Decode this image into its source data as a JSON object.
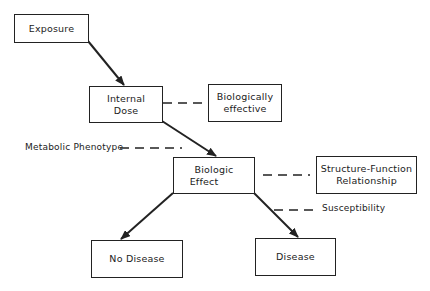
{
  "diagram": {
    "nodes": {
      "exposure": {
        "lines": [
          "Exposure"
        ]
      },
      "internal_dose": {
        "lines": [
          "Internal",
          "Dose"
        ]
      },
      "biologically_effective": {
        "lines": [
          "Biologically",
          "effective"
        ]
      },
      "biologic_effect": {
        "lines": [
          "Biologic",
          "Effect"
        ]
      },
      "structure_function": {
        "lines": [
          "Structure-Function",
          "Relationship"
        ]
      },
      "no_disease": {
        "lines": [
          "No Disease"
        ]
      },
      "disease": {
        "lines": [
          "Disease"
        ]
      }
    },
    "labels": {
      "metabolic_phenotype": "Metabolic Phenotype",
      "susceptibility": "Susceptibility"
    },
    "edges": [
      {
        "from": "exposure",
        "to": "internal_dose",
        "style": "arrow"
      },
      {
        "from": "internal_dose",
        "to": "biologic_effect",
        "style": "arrow"
      },
      {
        "from": "biologic_effect",
        "to": "no_disease",
        "style": "arrow"
      },
      {
        "from": "biologic_effect",
        "to": "disease",
        "style": "arrow"
      },
      {
        "from": "internal_dose",
        "to": "biologically_effective",
        "style": "dashed"
      },
      {
        "from": "metabolic_phenotype",
        "to": "biologic_effect",
        "style": "dashed"
      },
      {
        "from": "biologic_effect",
        "to": "structure_function",
        "style": "dashed"
      },
      {
        "from": "susceptibility",
        "to": "disease",
        "style": "dashed"
      }
    ],
    "colors": {
      "stroke": "#222222",
      "background": "#ffffff"
    }
  }
}
